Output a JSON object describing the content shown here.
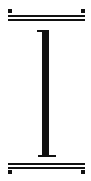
{
  "icon": {
    "name": "text-height-icon",
    "description": "I-beam glyph between two double horizontal rules with corner markers",
    "colors": {
      "foreground": "#111111",
      "background": "#ffffff"
    }
  }
}
